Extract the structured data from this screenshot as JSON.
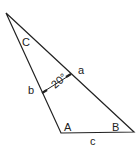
{
  "diagram": {
    "vertices": {
      "A": "A",
      "B": "B",
      "C": "C"
    },
    "sides": {
      "a": "a",
      "b": "b",
      "c": "c"
    },
    "dimension": {
      "label": "20°",
      "value": 20,
      "unit": "degrees"
    },
    "stroke_color": "#222222"
  }
}
